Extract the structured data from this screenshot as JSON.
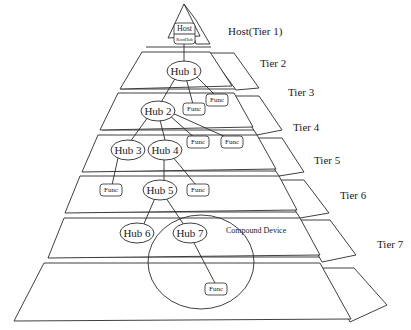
{
  "diagram": {
    "tiers": [
      {
        "label": "Host(Tier 1)"
      },
      {
        "label": "Tier 2"
      },
      {
        "label": "Tier 3"
      },
      {
        "label": "Tier 4"
      },
      {
        "label": "Tier 5"
      },
      {
        "label": "Tier 6"
      },
      {
        "label": "Tier 7"
      }
    ],
    "host": {
      "label": "Host",
      "sublabel": "RootHub"
    },
    "hubs": [
      {
        "label": "Hub 1"
      },
      {
        "label": "Hub 2"
      },
      {
        "label": "Hub 3"
      },
      {
        "label": "Hub 4"
      },
      {
        "label": "Hub 5"
      },
      {
        "label": "Hub 6"
      },
      {
        "label": "Hub 7"
      }
    ],
    "func_label": "Func",
    "funcs": [
      {
        "label": "Func",
        "tier": 3
      },
      {
        "label": "Func",
        "tier": 3
      },
      {
        "label": "Func",
        "tier": 4
      },
      {
        "label": "Func",
        "tier": 4
      },
      {
        "label": "Func",
        "tier": 5
      },
      {
        "label": "Func",
        "tier": 5
      },
      {
        "label": "Func",
        "tier": 7
      }
    ],
    "compound_device": {
      "label": "Compound Device"
    },
    "colors": {
      "stroke": "#2a2a2a",
      "fill": "#ffffff",
      "text": "#1a1a1a"
    }
  }
}
